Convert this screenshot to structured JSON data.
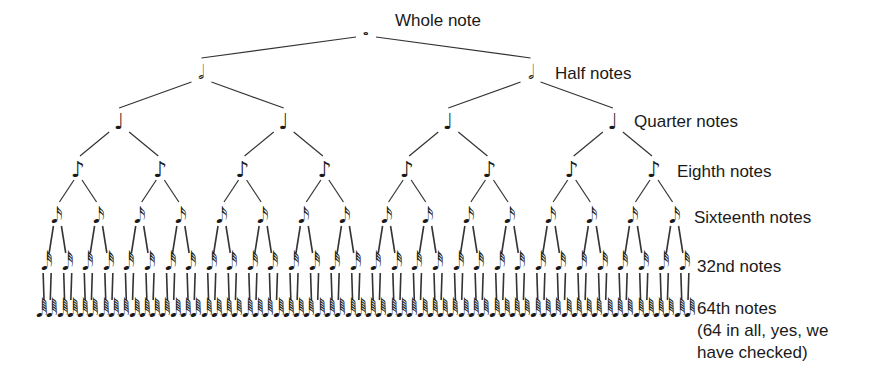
{
  "diagram": {
    "type": "binary-tree",
    "levels": [
      {
        "name": "whole",
        "label": "Whole note",
        "count": 1,
        "glyph": "𝅝",
        "y": 33,
        "label_x": 395,
        "label_y": 10
      },
      {
        "name": "half",
        "label": "Half notes",
        "count": 2,
        "glyph": "𝅗𝅥",
        "y": 76,
        "label_x": 555,
        "label_y": 63
      },
      {
        "name": "quarter",
        "label": "Quarter notes",
        "count": 4,
        "glyph": "♩",
        "y": 126,
        "label_x": 634,
        "label_y": 111
      },
      {
        "name": "eighth",
        "label": "Eighth notes",
        "count": 8,
        "glyph": "♪",
        "y": 174,
        "label_x": 677,
        "label_y": 161
      },
      {
        "name": "sixteenth",
        "label": "Sixteenth notes",
        "count": 16,
        "glyph": "𝅘𝅥𝅯",
        "y": 220,
        "label_x": 694,
        "label_y": 207
      },
      {
        "name": "32nd",
        "label": "32nd notes",
        "count": 32,
        "glyph": "𝅘𝅥𝅰",
        "y": 267,
        "label_x": 697,
        "label_y": 256
      },
      {
        "name": "64th",
        "label": "64th notes",
        "count": 64,
        "glyph": "𝅘𝅥𝅱",
        "y": 314,
        "label_x": 697,
        "label_y": 298
      }
    ],
    "note_text": [
      "(64 in all, yes, we",
      "have checked)"
    ],
    "layout": {
      "x_start": 42,
      "x_end": 690
    }
  },
  "colors": {
    "ink": "#1a1a1a",
    "line": "#333333",
    "background": "#ffffff"
  }
}
